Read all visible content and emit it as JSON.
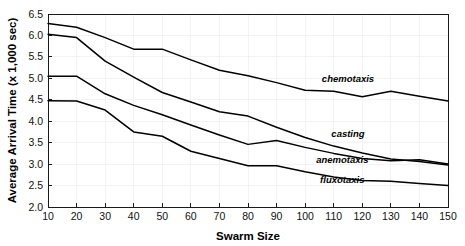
{
  "chart_data": {
    "type": "line",
    "title": "",
    "xlabel": "Swarm Size",
    "ylabel": "Average Arrival Time (x 1,000 sec)",
    "xlim": [
      10,
      150
    ],
    "ylim": [
      2.0,
      6.5
    ],
    "grid": true,
    "legend_position": "inline-annotations",
    "x": [
      10,
      20,
      30,
      40,
      50,
      60,
      70,
      80,
      90,
      100,
      110,
      120,
      130,
      140,
      150
    ],
    "xticks": [
      "10",
      "20",
      "30",
      "40",
      "50",
      "60",
      "70",
      "80",
      "90",
      "100",
      "110",
      "120",
      "130",
      "140",
      "150"
    ],
    "yticks": [
      "2.0",
      "2.5",
      "3.0",
      "3.5",
      "4.0",
      "4.5",
      "5.0",
      "5.5",
      "6.0",
      "6.5"
    ],
    "series": [
      {
        "name": "chemotaxis",
        "values": [
          6.28,
          6.19,
          5.95,
          5.68,
          5.68,
          5.43,
          5.19,
          5.06,
          4.9,
          4.72,
          4.7,
          4.57,
          4.7,
          4.58,
          4.47
        ]
      },
      {
        "name": "casting",
        "values": [
          6.03,
          5.95,
          5.4,
          5.03,
          4.67,
          4.45,
          4.22,
          4.12,
          3.86,
          3.62,
          3.42,
          3.26,
          3.12,
          3.06,
          2.98
        ]
      },
      {
        "name": "anemotaxis",
        "values": [
          5.05,
          5.05,
          4.64,
          4.37,
          4.15,
          3.91,
          3.68,
          3.46,
          3.55,
          3.39,
          3.25,
          3.13,
          3.08,
          3.1,
          3.0
        ]
      },
      {
        "name": "fluxotaxis",
        "values": [
          4.48,
          4.47,
          4.26,
          3.75,
          3.65,
          3.3,
          3.13,
          2.96,
          2.96,
          2.82,
          2.7,
          2.62,
          2.6,
          2.55,
          2.5
        ]
      }
    ],
    "annotations": [
      {
        "text": "chemotaxis",
        "x": 115,
        "y": 4.92
      },
      {
        "text": "casting",
        "x": 115,
        "y": 3.64
      },
      {
        "text": "anemotaxis",
        "x": 113,
        "y": 3.02
      },
      {
        "text": "fluxotaxis",
        "x": 113,
        "y": 2.56
      }
    ],
    "colors": {
      "line": "#000000",
      "axis": "#1a1a1a",
      "grid": "#f0f0f0",
      "background": "#ffffff"
    }
  }
}
